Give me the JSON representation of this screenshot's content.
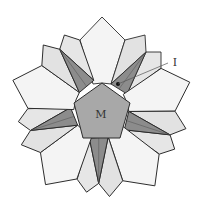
{
  "figure": {
    "center_label": "M",
    "pointer_label": "I",
    "colors": {
      "outline": "#2b2b2b",
      "white_petal": "#f4f4f4",
      "light_gray": "#dcdcdc",
      "mid_gray": "#bdbdbd",
      "dark_gray": "#8c8c8c",
      "center_pentagon": "#a8a8a8",
      "background": "#ffffff"
    },
    "symmetry": 5
  }
}
